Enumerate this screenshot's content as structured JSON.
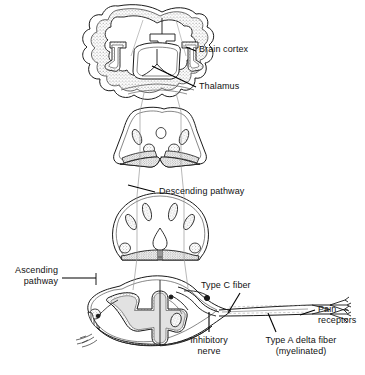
{
  "figure": {
    "background_color": "#ffffff",
    "line_color": "#1a1a1a",
    "fill_gray": "#d9d9d9",
    "pathway_line_color": "#8c8c8c"
  },
  "labels": {
    "brain_cortex": "Brain cortex",
    "thalamus": "Thalamus",
    "descending_pathway": "Descending pathway",
    "ascending_pathway_line1": "Ascending",
    "ascending_pathway_line2": "pathway",
    "type_c_fiber": "Type C fiber",
    "pain_receptors_line1": "Pain",
    "pain_receptors_line2": "receptors",
    "inhibitory_nerve_line1": "Inhibitory",
    "inhibitory_nerve_line2": "nerve",
    "type_a_delta_line1": "Type A delta fiber",
    "type_a_delta_line2": "(myelinated)"
  },
  "structures": {
    "brain": "coronal-brain-section",
    "midbrain": "midbrain-pons-section",
    "medulla": "medulla-section",
    "spinal_cord": "spinal-cord-section",
    "nerve_bundle": "peripheral-nerve-bundle",
    "receptor_endings": "free-nerve-endings"
  }
}
